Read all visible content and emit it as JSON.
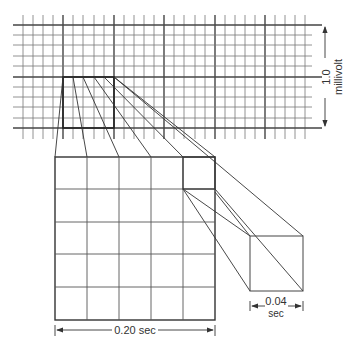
{
  "diagram": {
    "labels": {
      "voltage_value": "1.0",
      "voltage_unit": "millivolt",
      "large_box_duration": "0.20 sec",
      "small_box_value": "0.04",
      "small_box_unit": "sec"
    },
    "colors": {
      "line": "#3a3a3a",
      "thin_line": "#6a6a6a",
      "background": "#ffffff"
    },
    "grid": {
      "small_squares_per_large": 5,
      "large_square_time_sec": 0.2,
      "small_square_time_sec": 0.04,
      "large_square_voltage_mv": 1.0
    }
  }
}
